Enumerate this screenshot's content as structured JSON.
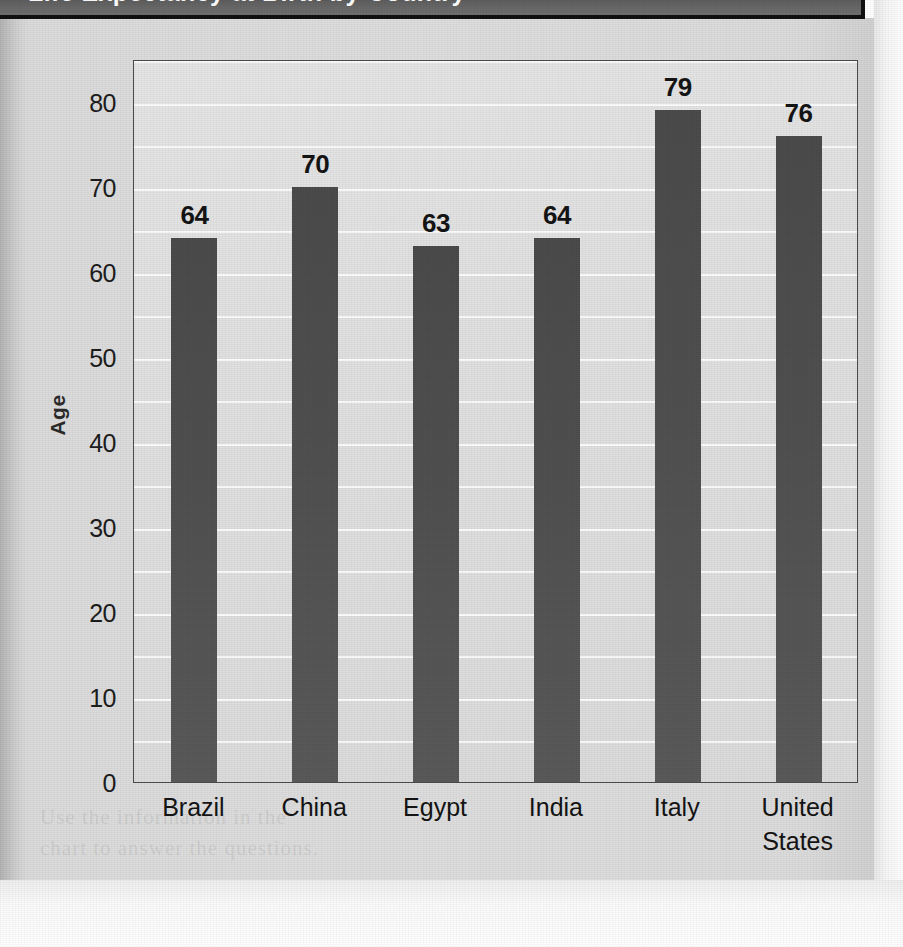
{
  "header": {
    "title_cropped": "Life Expectancy at Birth by Country",
    "bar_color": "#6a6a6a",
    "border_color": "#111111"
  },
  "page": {
    "paper_color": "#dedede",
    "margin_color": "#ffffff",
    "ghost_text": [
      "the chart below shows the",
      "life expectancy at birth",
      "data reported for each",
      "Use the information in the",
      "chart to answer the questions."
    ]
  },
  "chart_data": {
    "type": "bar",
    "title": "Life Expectancy at Birth by Country",
    "xlabel": "Country",
    "ylabel": "Age",
    "categories": [
      "Brazil",
      "China",
      "Egypt",
      "India",
      "Italy",
      "United States"
    ],
    "category_lines": [
      [
        "Brazil"
      ],
      [
        "China"
      ],
      [
        "Egypt"
      ],
      [
        "India"
      ],
      [
        "Italy"
      ],
      [
        "United",
        "States"
      ]
    ],
    "values": [
      64,
      70,
      63,
      64,
      79,
      76
    ],
    "data_labels": [
      "64",
      "70",
      "63",
      "64",
      "79",
      "76"
    ],
    "ylim": [
      0,
      85
    ],
    "y_major_ticks": [
      0,
      10,
      20,
      30,
      40,
      50,
      60,
      70,
      80
    ],
    "y_tick_labels": [
      "0",
      "10",
      "20",
      "30",
      "40",
      "50",
      "60",
      "70",
      "80"
    ],
    "y_minor_step": 5,
    "grid": true,
    "grid_color": "#fdfdfd",
    "legend": null,
    "legend_position": "none",
    "bar_color": "#4f4f4f",
    "plot_background": "#e2e2e2",
    "axis_color": "#4b4b4b",
    "series": [
      {
        "name": "Life expectancy",
        "values": [
          64,
          70,
          63,
          64,
          79,
          76
        ]
      }
    ]
  }
}
